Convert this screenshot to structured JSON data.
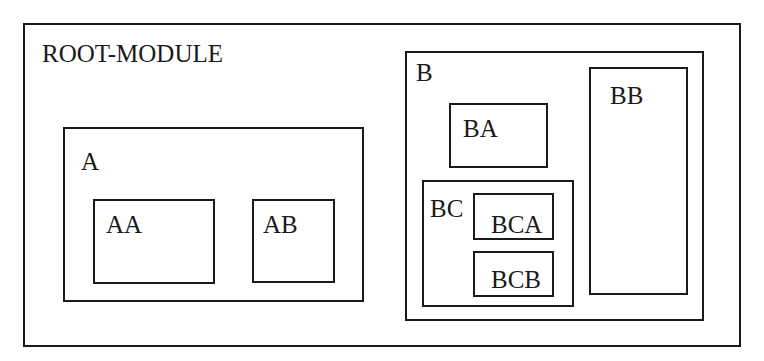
{
  "diagram": {
    "type": "nested-module-hierarchy",
    "stroke_color": "#1a1a1a",
    "background_color": "#ffffff",
    "root": {
      "label": "ROOT-MODULE",
      "children": [
        {
          "id": "A",
          "label": "A",
          "children": [
            {
              "id": "AA",
              "label": "AA"
            },
            {
              "id": "AB",
              "label": "AB"
            }
          ]
        },
        {
          "id": "B",
          "label": "B",
          "children": [
            {
              "id": "BA",
              "label": "BA"
            },
            {
              "id": "BB",
              "label": "BB"
            },
            {
              "id": "BC",
              "label": "BC",
              "children": [
                {
                  "id": "BCA",
                  "label": "BCA"
                },
                {
                  "id": "BCB",
                  "label": "BCB"
                }
              ]
            }
          ]
        }
      ]
    }
  },
  "labels": {
    "root": "ROOT-MODULE",
    "a": "A",
    "aa": "AA",
    "ab": "AB",
    "b": "B",
    "ba": "BA",
    "bb": "BB",
    "bc": "BC",
    "bca": "BCA",
    "bcb": "BCB"
  }
}
